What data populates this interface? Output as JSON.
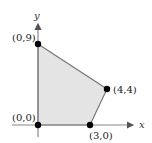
{
  "diagram": {
    "type": "feasible-region",
    "axes": {
      "x_label": "x",
      "y_label": "y"
    },
    "vertices": [
      {
        "label": "(0,0)",
        "x": 0,
        "y": 0
      },
      {
        "label": "(0,9)",
        "x": 0,
        "y": 9
      },
      {
        "label": "(4,4)",
        "x": 4,
        "y": 4
      },
      {
        "label": "(3,0)",
        "x": 3,
        "y": 0
      }
    ],
    "colors": {
      "region_fill": "#e4e4e4",
      "edge": "#777777",
      "axis": "#888888",
      "point": "#000000"
    }
  }
}
